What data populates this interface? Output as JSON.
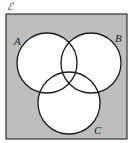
{
  "diagram": {
    "type": "venn",
    "universal_set": {
      "label": "ℰ",
      "fill": "#bebebe",
      "stroke": "#333333",
      "x": 6,
      "y": 14,
      "width": 121,
      "height": 125
    },
    "sets": [
      {
        "name": "A",
        "label": "A",
        "cx": 47,
        "cy": 63,
        "r": 30,
        "label_x": 14,
        "label_y": 45
      },
      {
        "name": "B",
        "label": "B",
        "cx": 91,
        "cy": 63,
        "r": 30,
        "label_x": 115,
        "label_y": 42
      },
      {
        "name": "C",
        "label": "C",
        "cx": 69,
        "cy": 103,
        "r": 31,
        "label_x": 94,
        "label_y": 134
      }
    ],
    "circle_fill": "#ffffff",
    "circle_stroke": "#1a1a1a"
  }
}
